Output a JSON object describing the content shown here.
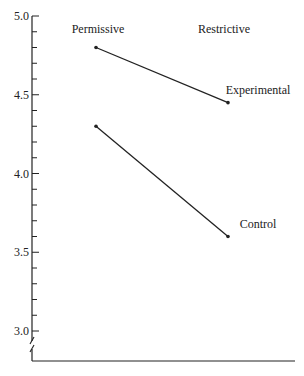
{
  "chart_data": {
    "type": "line",
    "title": "",
    "xlabel": "",
    "ylabel": "",
    "categories": [
      "Permissive",
      "Restrictive"
    ],
    "series": [
      {
        "name": "Experimental",
        "values": [
          4.8,
          4.45
        ]
      },
      {
        "name": "Control",
        "values": [
          4.3,
          3.6
        ]
      }
    ],
    "ylim": [
      3.0,
      5.0
    ],
    "y_ticks": [
      3.0,
      3.5,
      4.0,
      4.5,
      5.0
    ],
    "y_tick_labels": [
      "3.0",
      "3.5",
      "4.0",
      "4.5",
      "5.0"
    ],
    "y_minor_step": 0.1,
    "axis_break": true,
    "grid": false,
    "legend": "inline labels at right end of each line",
    "line_color": "#222222"
  }
}
